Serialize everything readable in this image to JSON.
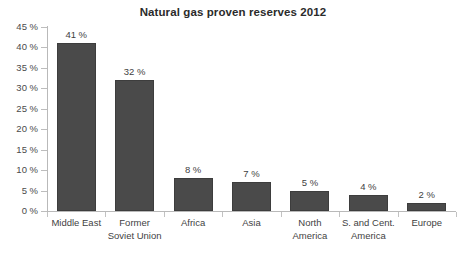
{
  "chart_data": {
    "type": "bar",
    "title": "Natural gas proven reserves 2012",
    "xlabel": "",
    "ylabel": "",
    "ylim": [
      0,
      45
    ],
    "grid": false,
    "legend": false,
    "categories": [
      "Middle East",
      "Former\nSoviet Union",
      "Africa",
      "Asia",
      "North\nAmerica",
      "S. and Cent.\nAmerica",
      "Europe"
    ],
    "values": [
      41,
      32,
      8,
      7,
      5,
      4,
      2
    ],
    "data_labels": [
      "41 %",
      "32 %",
      "8 %",
      "7 %",
      "5 %",
      "4 %",
      "2 %"
    ],
    "ytick_values": [
      0,
      5,
      10,
      15,
      20,
      25,
      30,
      35,
      40,
      45
    ],
    "ytick_labels": [
      "0 %",
      "5 %",
      "10 %",
      "15 %",
      "20 %",
      "25 %",
      "30 %",
      "35 %",
      "40 %",
      "45 %"
    ],
    "bar_color": "#4a4a4a",
    "axis_color": "#b9b9b9",
    "text_color": "#3f3f3f",
    "background": "#ffffff"
  }
}
